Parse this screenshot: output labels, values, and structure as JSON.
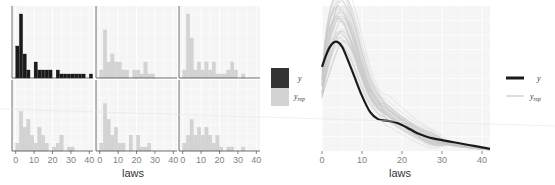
{
  "colors": {
    "y": "#1a1a1a",
    "yrep": "#d3d3d3",
    "yrep_line": "#c8c8c8",
    "panel_bg": "#f5f5f5",
    "grid": "#ffffff",
    "axis": "#333333",
    "tick_text": "#7f7f7f"
  },
  "chart_data": [
    {
      "type": "bar",
      "title": "",
      "subtitle": "Posterior predictive histograms (facets)",
      "xlabel": "laws",
      "ylabel": "",
      "xlim": [
        -2,
        42
      ],
      "x_ticks": [
        0,
        10,
        20,
        30,
        40
      ],
      "grid": true,
      "legend": {
        "position": "right",
        "entries": [
          {
            "label": "y",
            "color": "#1a1a1a"
          },
          {
            "label": "y_rep",
            "color": "#d3d3d3"
          }
        ]
      },
      "bin_width": 2,
      "bin_starts": [
        0,
        2,
        4,
        6,
        8,
        10,
        12,
        14,
        16,
        18,
        20,
        22,
        24,
        26,
        28,
        30,
        32,
        34,
        36,
        38,
        40
      ],
      "facets": [
        {
          "name": "y",
          "series": "y",
          "values": [
            4,
            8,
            3,
            1,
            0,
            2,
            1,
            1,
            1,
            1,
            0,
            1,
            0.5,
            0.5,
            0.5,
            0.5,
            0.5,
            0.5,
            0.5,
            0,
            0.5
          ]
        },
        {
          "name": "y_rep 1",
          "series": "y_rep",
          "values": [
            1,
            6,
            2,
            3,
            2,
            2,
            1,
            1,
            0,
            1,
            1,
            0.5,
            2,
            0.5,
            0.5,
            0,
            0,
            0,
            0,
            0,
            0
          ]
        },
        {
          "name": "y_rep 2",
          "series": "y_rep",
          "values": [
            1,
            8,
            5,
            1,
            2,
            1,
            2,
            1,
            2,
            0.5,
            0.5,
            0.5,
            1,
            2,
            1,
            0,
            0.5,
            0,
            0,
            0,
            0
          ]
        },
        {
          "name": "y_rep 3",
          "series": "y_rep",
          "values": [
            1,
            5,
            3,
            4,
            2,
            1,
            3,
            2,
            1,
            0,
            0.5,
            1,
            2,
            0,
            0.5,
            0.5,
            0,
            0,
            0,
            0,
            0
          ]
        },
        {
          "name": "y_rep 4",
          "series": "y_rep",
          "values": [
            1,
            6,
            4,
            2,
            3,
            1,
            1,
            0,
            2,
            0,
            2,
            0.5,
            0.5,
            1,
            0,
            0,
            0,
            0,
            0,
            0,
            0
          ]
        },
        {
          "name": "y_rep 5",
          "series": "y_rep",
          "values": [
            1,
            2,
            4,
            2,
            3,
            2,
            3,
            2,
            1,
            2,
            0.5,
            0,
            0.5,
            0.5,
            0,
            0,
            0.5,
            0,
            0,
            0,
            0
          ]
        }
      ],
      "ylim": [
        0,
        8.5
      ]
    },
    {
      "type": "line",
      "title": "",
      "subtitle": "Posterior predictive density overlay",
      "xlabel": "laws",
      "ylabel": "",
      "xlim": [
        0,
        42
      ],
      "x_ticks": [
        0,
        10,
        20,
        30,
        40
      ],
      "grid": true,
      "legend": {
        "position": "right",
        "entries": [
          {
            "label": "y",
            "color": "#1a1a1a"
          },
          {
            "label": "y_rep",
            "color": "#d3d3d3"
          }
        ]
      },
      "series": [
        {
          "name": "y",
          "x": [
            0,
            1,
            2,
            3,
            4,
            5,
            6,
            8,
            10,
            12,
            14,
            16,
            18,
            20,
            22,
            24,
            26,
            28,
            30,
            32,
            34,
            36,
            38,
            40,
            42
          ],
          "values": [
            0.058,
            0.066,
            0.072,
            0.075,
            0.075,
            0.072,
            0.066,
            0.052,
            0.038,
            0.027,
            0.022,
            0.021,
            0.02,
            0.018,
            0.015,
            0.012,
            0.01,
            0.0085,
            0.0075,
            0.0065,
            0.0055,
            0.0045,
            0.0035,
            0.0025,
            0.0015
          ]
        },
        {
          "name": "y_rep (mean of draws)",
          "x": [
            0,
            2,
            4,
            6,
            8,
            10,
            12,
            14,
            16,
            18,
            20,
            24,
            28,
            32,
            36,
            40,
            42
          ],
          "values": [
            0.045,
            0.075,
            0.09,
            0.088,
            0.075,
            0.057,
            0.042,
            0.033,
            0.028,
            0.024,
            0.02,
            0.013,
            0.008,
            0.005,
            0.003,
            0.0015,
            0.001
          ]
        }
      ],
      "ylim": [
        0,
        0.1
      ]
    }
  ],
  "left": {
    "x_ticks": [
      "0",
      "10",
      "20",
      "30",
      "40"
    ],
    "xlabel": "laws"
  },
  "left_legend": {
    "y_label": "y",
    "yrep_label": "y",
    "yrep_sub": "rep"
  },
  "right": {
    "x_ticks": [
      "0",
      "10",
      "20",
      "30",
      "40"
    ],
    "xlabel": "laws"
  },
  "right_legend": {
    "y_label": "y",
    "yrep_label": "y",
    "yrep_sub": "rep"
  }
}
